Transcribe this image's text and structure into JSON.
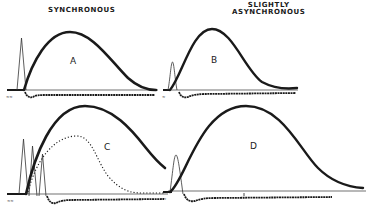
{
  "headings": {
    "synchronous": "SYNCHRONOUS",
    "asynchronous_line1": "SLIGHTLY",
    "asynchronous_line2": "ASYNCHRONOUS"
  },
  "panels": [
    {
      "id": "A",
      "label": "A",
      "condition": "synchronous",
      "spikes": 1,
      "dotted_curve": false
    },
    {
      "id": "B",
      "label": "B",
      "condition": "slightly asynchronous",
      "spikes": 1,
      "dotted_curve": false
    },
    {
      "id": "C",
      "label": "C",
      "condition": "synchronous",
      "spikes": 3,
      "dotted_curve": true
    },
    {
      "id": "D",
      "label": "D",
      "condition": "slightly asynchronous",
      "spikes": 1,
      "dotted_curve": false
    }
  ],
  "colors": {
    "ink": "#1a1a1a",
    "thin_line": "#333333",
    "background": "#ffffff"
  }
}
